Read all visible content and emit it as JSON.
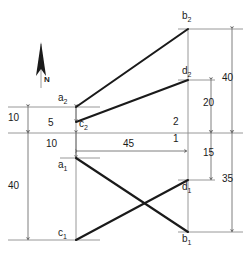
{
  "diagram": {
    "type": "survey-traverse-diagram",
    "title": "",
    "colors": {
      "figure_line": "#1a1a1a",
      "dimension_line": "#8c8c8c",
      "extension_line": "#9a9a9a",
      "background": "#ffffff",
      "text": "#1a1a1a"
    },
    "north_arrow": {
      "label": "N",
      "icon": "north-arrow-icon"
    },
    "points": [
      {
        "id": "a2",
        "base": "a",
        "sub": "2",
        "x": 76,
        "y": 107
      },
      {
        "id": "c2",
        "base": "c",
        "sub": "2",
        "x": 76,
        "y": 122
      },
      {
        "id": "b2",
        "base": "b",
        "sub": "2",
        "x": 188,
        "y": 29
      },
      {
        "id": "d2",
        "base": "d",
        "sub": "2",
        "x": 188,
        "y": 80
      },
      {
        "id": "a1",
        "base": "a",
        "sub": "1",
        "x": 76,
        "y": 158
      },
      {
        "id": "c1",
        "base": "c",
        "sub": "1",
        "x": 76,
        "y": 240
      },
      {
        "id": "d1",
        "base": "d",
        "sub": "1",
        "x": 188,
        "y": 180
      },
      {
        "id": "b1",
        "base": "b",
        "sub": "1",
        "x": 188,
        "y": 232
      }
    ],
    "segments": [
      {
        "name": "a2-b2",
        "from": "a2",
        "to": "b2"
      },
      {
        "name": "c2-d2",
        "from": "c2",
        "to": "d2"
      },
      {
        "name": "a1-b1",
        "from": "a1",
        "to": "b1"
      },
      {
        "name": "c1-d1",
        "from": "c1",
        "to": "d1"
      }
    ],
    "axis_labels": [
      {
        "name": "axis-label-2",
        "text": "2",
        "x": 173,
        "y": 119
      },
      {
        "name": "axis-label-1",
        "text": "1",
        "x": 173,
        "y": 134
      },
      {
        "name": "axis-label-5",
        "text": "5",
        "x": 48,
        "y": 119
      }
    ],
    "dimensions": [
      {
        "name": "dim-left-10",
        "value": "10",
        "orientation": "vertical",
        "label_x": 10,
        "label_y": 113
      },
      {
        "name": "dim-left-40",
        "value": "40",
        "orientation": "vertical",
        "label_x": 10,
        "label_y": 184
      },
      {
        "name": "dim-inner-10",
        "value": "10",
        "orientation": "vertical",
        "label_x": 48,
        "label_y": 142
      },
      {
        "name": "dim-mid-45",
        "value": "45",
        "orientation": "horizontal",
        "label_x": 123,
        "label_y": 143
      },
      {
        "name": "dim-right-40",
        "value": "40",
        "orientation": "vertical",
        "label_x": 225,
        "label_y": 76
      },
      {
        "name": "dim-right-20",
        "value": "20",
        "orientation": "vertical",
        "label_x": 205,
        "label_y": 101
      },
      {
        "name": "dim-right-15",
        "value": "15",
        "orientation": "vertical",
        "label_x": 205,
        "label_y": 151
      },
      {
        "name": "dim-right-35",
        "value": "35",
        "orientation": "vertical",
        "label_x": 225,
        "label_y": 177
      }
    ]
  }
}
